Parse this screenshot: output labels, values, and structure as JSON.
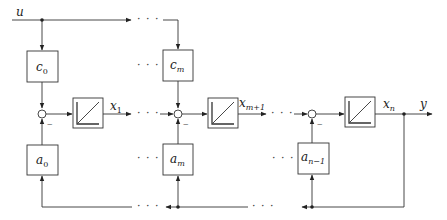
{
  "diagram": {
    "input_label": "u",
    "output_label": "y",
    "ellipsis": "· · ·",
    "minus_sign": "−",
    "gain_blocks_top": [
      {
        "base": "c",
        "sub": "0"
      },
      {
        "base": "c",
        "sub": "m"
      }
    ],
    "gain_blocks_bottom": [
      {
        "base": "a",
        "sub": "0"
      },
      {
        "base": "a",
        "sub": "m"
      },
      {
        "base": "a",
        "sub": "n−1"
      }
    ],
    "states": [
      {
        "base": "x",
        "sub": "1"
      },
      {
        "base": "x",
        "sub": "m+1"
      },
      {
        "base": "x",
        "sub": "n"
      }
    ],
    "integrator_icon": "integrator-ramp-icon",
    "summing_junction_icon": "summing-junction-circle"
  }
}
